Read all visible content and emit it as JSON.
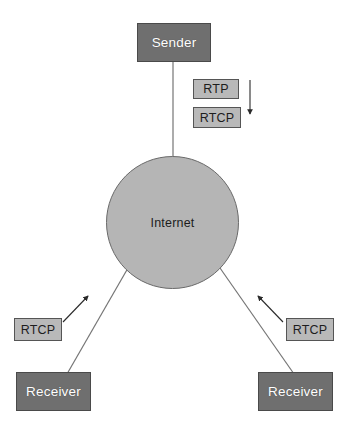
{
  "diagram": {
    "colors": {
      "node_fill": "#6f6f6f",
      "node_border": "#4a4a4a",
      "node_text": "#ffffff",
      "proto_fill": "#b9b9b9",
      "proto_border": "#555555",
      "proto_text": "#1d1d1d",
      "cloud_fill": "#b5b5b5",
      "cloud_border": "#6a6a6a",
      "line": "#6e6e6e",
      "arrow": "#2a2a2a",
      "background": "#ffffff"
    },
    "nodes": {
      "sender": {
        "label": "Sender"
      },
      "internet": {
        "label": "Internet"
      },
      "receiver_left": {
        "label": "Receiver"
      },
      "receiver_right": {
        "label": "Receiver"
      }
    },
    "protocol_labels": {
      "rtp_down": "RTP",
      "rtcp_down": "RTCP",
      "rtcp_left_up": "RTCP",
      "rtcp_right_up": "RTCP"
    },
    "arrows": {
      "downstream": {
        "direction": "down",
        "meaning": "RTP and RTCP from sender to Internet"
      },
      "upstream_left": {
        "direction": "up-right",
        "meaning": "RTCP from left receiver toward Internet"
      },
      "upstream_right": {
        "direction": "up-left",
        "meaning": "RTCP from right receiver toward Internet"
      }
    },
    "links": [
      {
        "from": "sender",
        "to": "internet"
      },
      {
        "from": "internet",
        "to": "receiver_left"
      },
      {
        "from": "internet",
        "to": "receiver_right"
      }
    ]
  }
}
